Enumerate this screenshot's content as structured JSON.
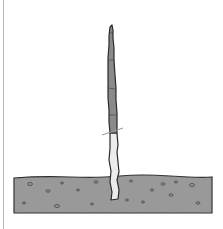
{
  "illustration": {
    "subject": "tree whip planted in soil with cut mark",
    "colors": {
      "background": "#ffffff",
      "stem_upper": "#8a8a8a",
      "stem_lower": "#ececec",
      "outline": "#2a2a2a",
      "soil": "#9a9a9a",
      "soil_speck": "#555555",
      "cut_line": "#999999",
      "border": "#b8b8b8"
    }
  }
}
